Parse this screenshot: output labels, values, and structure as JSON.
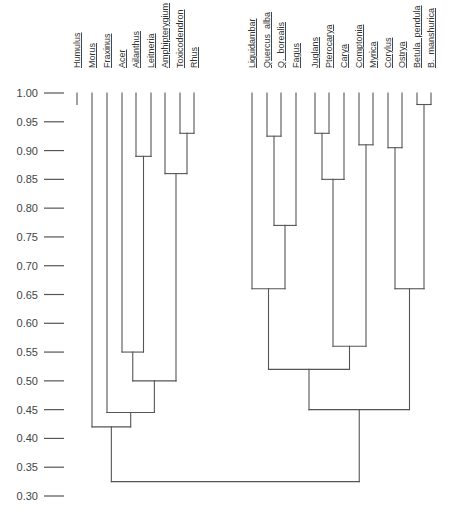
{
  "chart_data": {
    "type": "dendrogram",
    "title": "",
    "ylabel": "",
    "ylim": [
      0.3,
      1.0
    ],
    "yticks": [
      "1.00",
      "0.95",
      "0.90",
      "0.85",
      "0.80",
      "0.75",
      "0.70",
      "0.65",
      "0.60",
      "0.55",
      "0.50",
      "0.45",
      "0.40",
      "0.35",
      "0.30"
    ],
    "leaves": [
      "Humulus",
      "Morus",
      "Fraxinus",
      "Acer",
      "Ailanthus",
      "Leitneria",
      "Amphipterygium",
      "Toxicodendron",
      "Rhus",
      "Liquidambar",
      "Quercus  alba",
      "Q.  borealis",
      "Fagus",
      "Juglans",
      "Pterocarya",
      "Carya",
      "Comptonia",
      "Myrica",
      "Corylus",
      "Ostrya",
      "Betula  pendula",
      "B.  manshurica"
    ],
    "merges": [
      {
        "id": "c1",
        "children": [
          "Toxicodendron",
          "Rhus"
        ],
        "height": 0.93
      },
      {
        "id": "c2",
        "children": [
          "Amphipterygium",
          "c1"
        ],
        "height": 0.86
      },
      {
        "id": "c3",
        "children": [
          "Ailanthus",
          "Leitneria"
        ],
        "height": 0.89
      },
      {
        "id": "c4",
        "children": [
          "Acer",
          "c3"
        ],
        "height": 0.55
      },
      {
        "id": "c5",
        "children": [
          "c4",
          "c2"
        ],
        "height": 0.5
      },
      {
        "id": "c6",
        "children": [
          "Fraxinus",
          "c5"
        ],
        "height": 0.445
      },
      {
        "id": "c7",
        "children": [
          "Morus",
          "c6"
        ],
        "height": 0.42
      },
      {
        "id": "c8",
        "children": [
          "Quercus  alba",
          "Q.  borealis"
        ],
        "height": 0.925
      },
      {
        "id": "c9",
        "children": [
          "c8",
          "Fagus"
        ],
        "height": 0.77
      },
      {
        "id": "c10",
        "children": [
          "Liquidambar",
          "c9"
        ],
        "height": 0.66
      },
      {
        "id": "c11",
        "children": [
          "Juglans",
          "Pterocarya"
        ],
        "height": 0.93
      },
      {
        "id": "c12",
        "children": [
          "c11",
          "Carya"
        ],
        "height": 0.85
      },
      {
        "id": "c13",
        "children": [
          "Comptonia",
          "Myrica"
        ],
        "height": 0.91
      },
      {
        "id": "c14",
        "children": [
          "c12",
          "c13"
        ],
        "height": 0.56
      },
      {
        "id": "c15",
        "children": [
          "c10",
          "c14"
        ],
        "height": 0.52
      },
      {
        "id": "c16",
        "children": [
          "Corylus",
          "Ostrya"
        ],
        "height": 0.905
      },
      {
        "id": "c17",
        "children": [
          "Betula  pendula",
          "B.  manshurica"
        ],
        "height": 0.98
      },
      {
        "id": "c18",
        "children": [
          "c16",
          "c17"
        ],
        "height": 0.66
      },
      {
        "id": "c19",
        "children": [
          "c15",
          "c18"
        ],
        "height": 0.45
      },
      {
        "id": "c20",
        "children": [
          "c7",
          "c19"
        ],
        "height": 0.325
      }
    ],
    "unmerged_stub": {
      "leaf": "Humulus",
      "bottom": 0.98
    },
    "grid": false,
    "legend": null
  },
  "layout": {
    "line_color": "#555555",
    "y_top_px": 93,
    "y_bottom_px": 496,
    "leaf_x_px": {
      "Humulus": 77,
      "Morus": 92,
      "Fraxinus": 107,
      "Acer": 122,
      "Ailanthus": 136,
      "Leitneria": 151,
      "Amphipterygium": 165,
      "Toxicodendron": 180,
      "Rhus": 194,
      "Liquidambar": 252,
      "Quercus  alba": 267,
      "Q.  borealis": 281,
      "Fagus": 296,
      "Juglans": 315,
      "Pterocarya": 329,
      "Carya": 344,
      "Comptonia": 359,
      "Myrica": 373,
      "Corylus": 388,
      "Ostrya": 402,
      "Betula  pendula": 417,
      "B.  manshurica": 431
    }
  }
}
